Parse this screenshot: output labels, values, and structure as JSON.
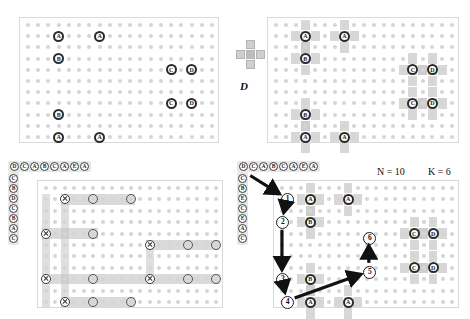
{
  "figure": {
    "background": "#ffffff",
    "grid_dot_color": "#d5d5d5",
    "shade_color": "#c9c9c9",
    "panel_border": "#d9d9d9",
    "arrow_color": "#111111"
  },
  "structuring_element": {
    "name": "cross-structuring-element",
    "label": "D",
    "shape": "plus",
    "cells": [
      [
        1,
        0
      ],
      [
        0,
        1
      ],
      [
        1,
        1
      ],
      [
        2,
        1
      ],
      [
        1,
        2
      ]
    ]
  },
  "panels": {
    "top_left": {
      "name": "input-lattice",
      "cols": 19,
      "rows": 11,
      "points": [
        {
          "label": "A",
          "col": 3,
          "row": 1
        },
        {
          "label": "A",
          "col": 7,
          "row": 1
        },
        {
          "label": "B",
          "col": 3,
          "row": 3
        },
        {
          "label": "C",
          "col": 14,
          "row": 4
        },
        {
          "label": "D",
          "col": 16,
          "row": 4
        },
        {
          "label": "C",
          "col": 14,
          "row": 7
        },
        {
          "label": "D",
          "col": 16,
          "row": 7
        },
        {
          "label": "B",
          "col": 3,
          "row": 8
        },
        {
          "label": "A",
          "col": 3,
          "row": 10
        },
        {
          "label": "A",
          "col": 7,
          "row": 10
        }
      ]
    },
    "top_right": {
      "name": "dilated-lattice",
      "cols": 19,
      "rows": 11,
      "points": [
        {
          "label": "A",
          "col": 3,
          "row": 1
        },
        {
          "label": "A",
          "col": 7,
          "row": 1
        },
        {
          "label": "B",
          "col": 3,
          "row": 3
        },
        {
          "label": "C",
          "col": 14,
          "row": 4
        },
        {
          "label": "D",
          "col": 16,
          "row": 4
        },
        {
          "label": "C",
          "col": 14,
          "row": 7
        },
        {
          "label": "D",
          "col": 16,
          "row": 7
        },
        {
          "label": "B",
          "col": 3,
          "row": 8
        },
        {
          "label": "A",
          "col": 3,
          "row": 10
        },
        {
          "label": "A",
          "col": 7,
          "row": 10
        }
      ]
    },
    "bottom_left": {
      "name": "scanline-decomposition",
      "cols": 19,
      "rows": 11,
      "column_header": [
        "D",
        "C",
        "A",
        "B",
        "C",
        "A",
        "E",
        "A"
      ],
      "row_header": [
        "C",
        "B",
        "D",
        "C",
        "B",
        "A",
        "C"
      ],
      "x_markers": [
        {
          "col": 2,
          "row": 1
        },
        {
          "col": 0,
          "row": 4
        },
        {
          "col": 0,
          "row": 8
        },
        {
          "col": 2,
          "row": 10
        },
        {
          "col": 11,
          "row": 5
        },
        {
          "col": 11,
          "row": 8
        }
      ],
      "o_markers": [
        {
          "col": 5,
          "row": 1
        },
        {
          "col": 9,
          "row": 1
        },
        {
          "col": 5,
          "row": 4
        },
        {
          "col": 5,
          "row": 8
        },
        {
          "col": 5,
          "row": 10
        },
        {
          "col": 9,
          "row": 10
        },
        {
          "col": 15,
          "row": 5
        },
        {
          "col": 18,
          "row": 5
        },
        {
          "col": 15,
          "row": 8
        },
        {
          "col": 18,
          "row": 8
        }
      ]
    },
    "bottom_right": {
      "name": "traversal-path",
      "cols": 19,
      "rows": 11,
      "column_header": [
        "D",
        "C",
        "A",
        "B",
        "C",
        "A",
        "E",
        "A"
      ],
      "row_header": [
        "C",
        "B",
        "E",
        "C",
        "E",
        "A",
        "C"
      ],
      "annotations": {
        "N_label": "N = 10",
        "K_label": "K = 6",
        "N": 10,
        "K": 6
      },
      "points": [
        {
          "label": "A",
          "col": 3,
          "row": 1
        },
        {
          "label": "A",
          "col": 7,
          "row": 1
        },
        {
          "label": "B",
          "col": 3,
          "row": 3
        },
        {
          "label": "C",
          "col": 14,
          "row": 4
        },
        {
          "label": "D",
          "col": 16,
          "row": 4
        },
        {
          "label": "C",
          "col": 14,
          "row": 7
        },
        {
          "label": "D",
          "col": 16,
          "row": 7
        },
        {
          "label": "B",
          "col": 3,
          "row": 8
        },
        {
          "label": "A",
          "col": 3,
          "row": 10
        },
        {
          "label": "A",
          "col": 7,
          "row": 10
        }
      ],
      "steps": [
        {
          "n": "1",
          "col": 0.6,
          "row": 1.0
        },
        {
          "n": "2",
          "col": 0.1,
          "row": 3.0
        },
        {
          "n": "3",
          "col": 0.1,
          "row": 8.0
        },
        {
          "n": "4",
          "col": 0.6,
          "row": 10.0
        },
        {
          "n": "5",
          "col": 9.3,
          "row": 7.4
        },
        {
          "n": "6",
          "col": 9.3,
          "row": 4.4
        }
      ],
      "arrows": [
        {
          "from_step": "start",
          "to_step": "1"
        },
        {
          "from_step": "1",
          "to_step": "2"
        },
        {
          "from_step": "2",
          "to_step": "3"
        },
        {
          "from_step": "3",
          "to_step": "4"
        },
        {
          "from_step": "4",
          "to_step": "5"
        },
        {
          "from_step": "5",
          "to_step": "6"
        }
      ]
    }
  }
}
